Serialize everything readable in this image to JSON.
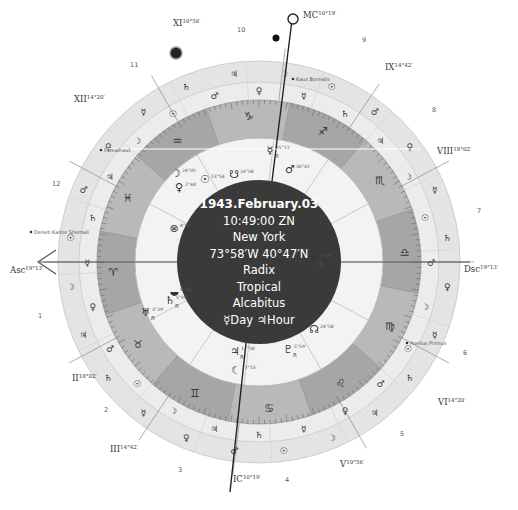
{
  "chart_info": {
    "date": "1943.February.03",
    "time": "10:49:00 ZN",
    "place": "New York",
    "coordinates": "73°58′W 40°47′N",
    "chart_type": "Radix",
    "zodiac": "Tropical",
    "house_system": "Alcabitus",
    "day_hour": "☿Day ♃Hour"
  },
  "angles": {
    "asc": {
      "label": "Asc",
      "degree": "19°13′"
    },
    "dsc": {
      "label": "Dsc",
      "degree": "19°13′"
    },
    "mc": {
      "label": "MC",
      "degree": "10°19′"
    },
    "ic": {
      "label": "IC",
      "degree": "10°19′"
    }
  },
  "house_cusps": [
    {
      "label": "II",
      "degree": "18°02′"
    },
    {
      "label": "III",
      "degree": "14°42′"
    },
    {
      "label": "V",
      "degree": "10°56′"
    },
    {
      "label": "VI",
      "degree": "14°20′"
    },
    {
      "label": "VIII",
      "degree": "18°02′"
    },
    {
      "label": "IX",
      "degree": "14°42′"
    },
    {
      "label": "XI",
      "degree": "10°56′"
    },
    {
      "label": "XII",
      "degree": "14°20′"
    }
  ],
  "house_numbers": [
    "1",
    "2",
    "3",
    "4",
    "5",
    "6",
    "7",
    "8",
    "9",
    "10",
    "11",
    "12"
  ],
  "signs": [
    "♈",
    "♉",
    "♊",
    "♋",
    "♌",
    "♍",
    "♎",
    "♏",
    "♐",
    "♑",
    "♒",
    "♓"
  ],
  "fixed_stars": [
    "Kaus Borealis",
    "Fomalhaut",
    "Deneb Kaitos Shemali",
    "Asellus Primus"
  ],
  "planets": [
    {
      "glyph": "♅",
      "degree": "3°39′",
      "retro": "R"
    },
    {
      "glyph": "♄",
      "degree": "5°08′",
      "retro": "R"
    },
    {
      "glyph": "♃",
      "degree": "17°58′",
      "retro": "R"
    },
    {
      "glyph": "☾",
      "degree": "17°53′",
      "retro": ""
    },
    {
      "glyph": "♇",
      "degree": "5°59′",
      "retro": "R"
    },
    {
      "glyph": "☊",
      "degree": "24°58′",
      "retro": ""
    },
    {
      "glyph": "♆",
      "degree": "1°48′",
      "retro": "R"
    },
    {
      "glyph": "⊗",
      "degree": "8°03′",
      "retro": ""
    },
    {
      "glyph": "⯋",
      "degree": "8°23′",
      "retro": ""
    },
    {
      "glyph": "♀",
      "degree": "2°48′",
      "retro": ""
    },
    {
      "glyph": "☋",
      "degree": "24°58′",
      "retro": ""
    },
    {
      "glyph": "☉",
      "degree": "13°54′",
      "retro": ""
    },
    {
      "glyph": "☽",
      "degree": "24°05′",
      "retro": ""
    },
    {
      "glyph": "☿",
      "degree": "25°11′",
      "retro": "R"
    },
    {
      "glyph": "♂",
      "degree": "30°42′",
      "retro": ""
    }
  ],
  "colors": {
    "background": "#ffffff",
    "outer_ring": "#e6e6e6",
    "outer_ring_band": "#d9d9d9",
    "zodiac_ring": "#a8a8a8",
    "zodiac_ring_alt": "#bcbcbc",
    "inner_area": "#efefef",
    "center_disc": "#3a3a3a",
    "lines": "#444444"
  }
}
